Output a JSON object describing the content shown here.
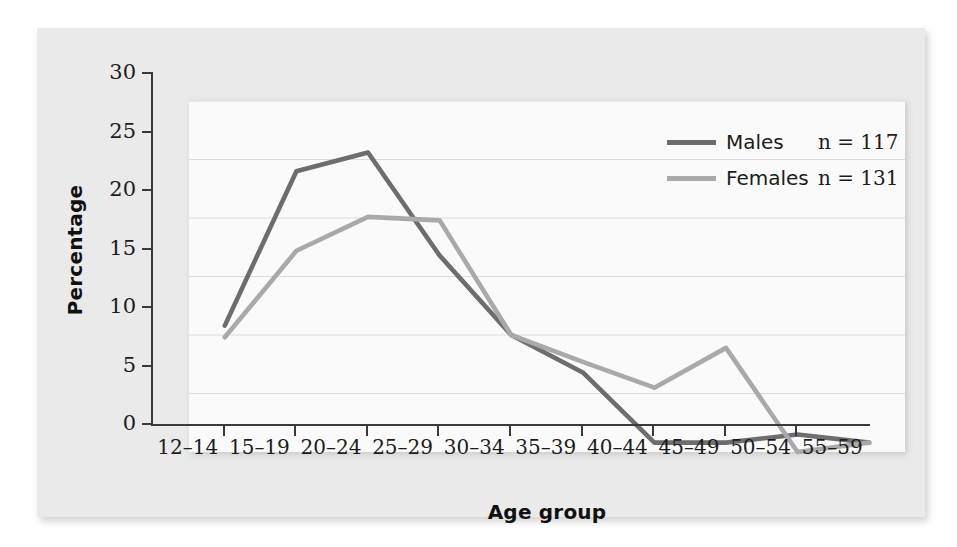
{
  "chart_data": {
    "type": "line",
    "title": "",
    "xlabel": "Age group",
    "ylabel": "Percentage",
    "categories": [
      "12–14",
      "15–19",
      "20–24",
      "25–29",
      "30–34",
      "35–39",
      "40–44",
      "45–49",
      "50–54",
      "55–59"
    ],
    "series": [
      {
        "name": "Males",
        "values": [
          10.8,
          24.0,
          25.6,
          16.8,
          10.0,
          6.8,
          0.8,
          0.8,
          1.5,
          0.8
        ],
        "color": "#6d6d6d"
      },
      {
        "name": "Females",
        "values": [
          9.8,
          17.2,
          20.1,
          19.8,
          10.0,
          7.7,
          5.5,
          8.9,
          0.0,
          0.8
        ],
        "color": "#a9a9a9"
      }
    ],
    "ylim": [
      0,
      30
    ],
    "yticks": [
      0,
      5,
      10,
      15,
      20,
      25,
      30
    ],
    "ytick_labels": [
      "0",
      "5",
      "10",
      "15",
      "20",
      "25",
      "30"
    ],
    "grid": "horizontal",
    "legend_position": "top-right"
  },
  "legend": {
    "entries": [
      {
        "label": "Males",
        "count_label": "n = 117"
      },
      {
        "label": "Females",
        "count_label": "n = 131"
      }
    ]
  },
  "colors": {
    "males_line": "#6d6d6d",
    "females_line": "#a9a9a9",
    "panel_background": "#eaeaea",
    "plot_background": "#fafafa",
    "axis": "#3a3a3a",
    "gridline": "#dcdcdc",
    "text": "#1c1c1c"
  }
}
